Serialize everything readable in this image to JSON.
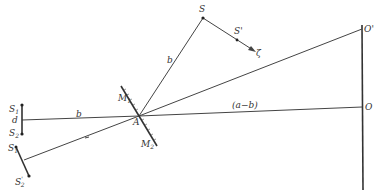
{
  "diagram": {
    "type": "optics-mirror-interference",
    "labels": {
      "S": "S",
      "S_prime": "S'",
      "zeta": "ζ",
      "b_upper": "b",
      "b_lower": "b",
      "M1": "M",
      "M1_sub": "1",
      "M2": "M",
      "M2_sub": "2",
      "A": "A",
      "a_minus_b": "(a−b)",
      "O": "O",
      "O_prime": "O'",
      "S1": "S",
      "S1_sub": "1",
      "d": "d",
      "S2": "S",
      "S2_sub": "2",
      "S1_prime": "S",
      "S1_prime_sub": "1",
      "S2_prime": "S",
      "S2_prime_sub": "2",
      "S2_prime_mark": "'"
    },
    "colors": {
      "line": "#444444",
      "background": "#ffffff"
    }
  }
}
